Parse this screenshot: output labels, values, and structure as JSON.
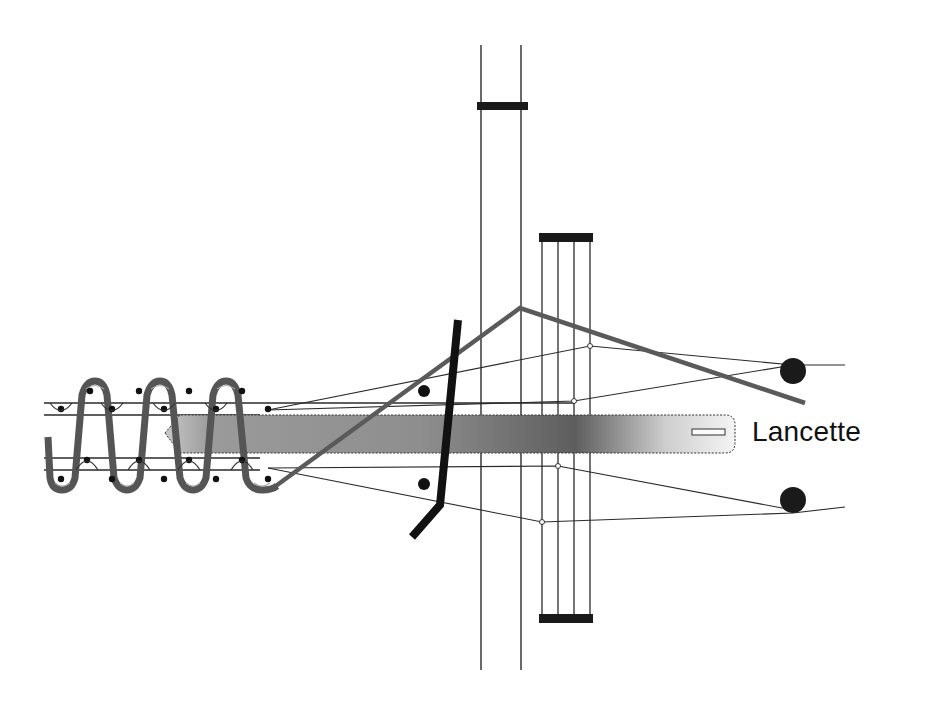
{
  "diagram": {
    "type": "loom-mechanism",
    "labels": {
      "lancet": "Lancette"
    },
    "colors": {
      "background": "#ffffff",
      "line": "#2a2a2a",
      "coil": "#555555",
      "coil_highlight": "#9a9a9a",
      "weft": "#5a5a5a",
      "reed": "#111111",
      "lancet_dark": "#5c5c5c",
      "lancet_mid": "#8a8a8a",
      "lancet_light": "#f2f2f2",
      "harness_bar": "#1a1a1a"
    },
    "components": [
      "coil-spring",
      "guide-lines",
      "lancet",
      "weft-thread",
      "reed-bar",
      "harness-1",
      "harness-2",
      "warp-threads",
      "tension-rollers"
    ]
  }
}
